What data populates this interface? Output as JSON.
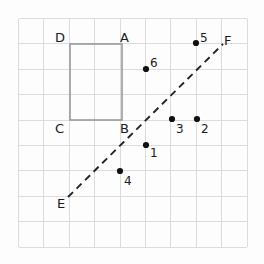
{
  "figure": {
    "background_color": "#fdfdfd",
    "grid": {
      "color": "#dcdcdc",
      "x_start": 18,
      "y_start": 18,
      "cell_size": 25.4,
      "columns": 9,
      "rows": 9,
      "visible": true
    },
    "rectangle": {
      "name": "rectangle-ABCD",
      "stroke_color": "#9a9a9a",
      "x": 70,
      "y": 44,
      "width": 52,
      "height": 76,
      "vertices": [
        {
          "label": "D",
          "x": 70,
          "y": 44,
          "label_x": 55,
          "label_y": 42
        },
        {
          "label": "A",
          "x": 122,
          "y": 44,
          "label_x": 120,
          "label_y": 42
        },
        {
          "label": "C",
          "x": 70,
          "y": 120,
          "label_x": 55,
          "label_y": 133
        },
        {
          "label": "B",
          "x": 122,
          "y": 120,
          "label_x": 120,
          "label_y": 133
        }
      ]
    },
    "dashed_line": {
      "name": "line-EF",
      "stroke_color": "#232323",
      "dash_pattern": "7 5",
      "x1": 68,
      "y1": 197,
      "x2": 223,
      "y2": 44,
      "endpoints": [
        {
          "label": "E",
          "label_x": 57,
          "label_y": 208
        },
        {
          "label": "F",
          "label_x": 224,
          "label_y": 45
        }
      ]
    },
    "points": [
      {
        "label": "1",
        "cx": 146,
        "cy": 145,
        "label_x": 150,
        "label_y": 157
      },
      {
        "label": "2",
        "cx": 197,
        "cy": 119,
        "label_x": 201,
        "label_y": 133
      },
      {
        "label": "3",
        "cx": 172,
        "cy": 119,
        "label_x": 176,
        "label_y": 133
      },
      {
        "label": "4",
        "cx": 120,
        "cy": 171,
        "label_x": 124,
        "label_y": 185
      },
      {
        "label": "5",
        "cx": 196,
        "cy": 43,
        "label_x": 200,
        "label_y": 42
      },
      {
        "label": "6",
        "cx": 146,
        "cy": 69,
        "label_x": 150,
        "label_y": 67
      }
    ],
    "point_radius": 3.1
  }
}
